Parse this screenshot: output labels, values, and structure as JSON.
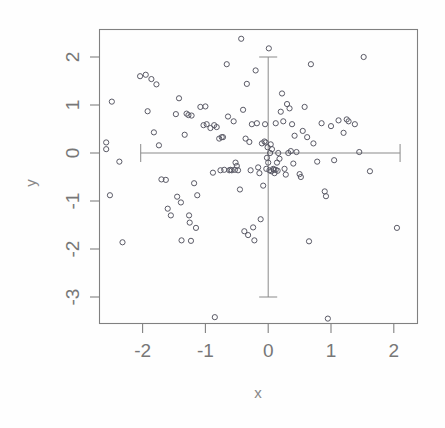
{
  "figure": {
    "title": "",
    "background_color": "#fefefe",
    "point_color": "#5a5a66",
    "axis_color": "#808080",
    "label_color": "#777777"
  },
  "axes": {
    "x_label": "x",
    "y_label": "y",
    "x_ticks": [
      "-2",
      "-1",
      "0",
      "1",
      "2"
    ],
    "y_ticks": [
      "2",
      "1",
      "0",
      "-1",
      "-2",
      "-3"
    ]
  },
  "chart_data": {
    "type": "scatter",
    "title": "",
    "xlabel": "x",
    "ylabel": "y",
    "xlim": [
      -2.7,
      2.35
    ],
    "ylim": [
      -3.6,
      2.45
    ],
    "x_ticks": [
      -2,
      -1,
      0,
      1,
      2
    ],
    "y_ticks": [
      2,
      1,
      0,
      -1,
      -2,
      -3
    ],
    "grid": false,
    "legend": false,
    "marker": "open-circle",
    "annotations": [
      {
        "name": "horizontal-whisker",
        "orientation": "horizontal",
        "at": 0.0,
        "from": -2.03,
        "to": 2.1,
        "caps": true
      },
      {
        "name": "vertical-whisker",
        "orientation": "vertical",
        "at": 0.0,
        "from": -3.0,
        "to": 2.0,
        "caps": true
      }
    ],
    "points": [
      [
        -2.58,
        0.22
      ],
      [
        -2.58,
        0.08
      ],
      [
        -2.49,
        1.07
      ],
      [
        -2.52,
        -0.88
      ],
      [
        -2.37,
        -0.18
      ],
      [
        -2.32,
        -1.86
      ],
      [
        -2.04,
        1.6
      ],
      [
        -1.95,
        1.63
      ],
      [
        -1.92,
        0.87
      ],
      [
        -1.86,
        1.54
      ],
      [
        -1.82,
        0.43
      ],
      [
        -1.78,
        1.43
      ],
      [
        -1.74,
        0.16
      ],
      [
        -1.7,
        -0.55
      ],
      [
        -1.63,
        -0.56
      ],
      [
        -1.6,
        -1.16
      ],
      [
        -1.55,
        -1.3
      ],
      [
        -1.45,
        -0.91
      ],
      [
        -1.42,
        1.14
      ],
      [
        -1.47,
        0.81
      ],
      [
        -1.39,
        -1.03
      ],
      [
        -1.38,
        -1.82
      ],
      [
        -1.33,
        0.38
      ],
      [
        -1.3,
        0.82
      ],
      [
        -1.27,
        0.79
      ],
      [
        -1.26,
        -1.3
      ],
      [
        -1.25,
        -1.45
      ],
      [
        -1.23,
        -1.83
      ],
      [
        -1.22,
        0.78
      ],
      [
        -1.18,
        -0.63
      ],
      [
        -1.15,
        -1.56
      ],
      [
        -1.13,
        -0.88
      ],
      [
        -1.08,
        0.96
      ],
      [
        -1.03,
        0.58
      ],
      [
        -1.0,
        0.97
      ],
      [
        -0.98,
        0.6
      ],
      [
        -0.92,
        0.52
      ],
      [
        -0.88,
        -0.41
      ],
      [
        -0.86,
        0.58
      ],
      [
        -0.85,
        -3.42
      ],
      [
        -0.82,
        0.54
      ],
      [
        -0.78,
        0.3
      ],
      [
        -0.76,
        -0.36
      ],
      [
        -0.74,
        0.33
      ],
      [
        -0.72,
        0.33
      ],
      [
        -0.7,
        -0.35
      ],
      [
        -0.66,
        1.85
      ],
      [
        -0.64,
        0.76
      ],
      [
        -0.62,
        -0.36
      ],
      [
        -0.58,
        -0.36
      ],
      [
        -0.55,
        0.66
      ],
      [
        -0.53,
        -0.35
      ],
      [
        -0.52,
        -0.2
      ],
      [
        -0.5,
        -0.27
      ],
      [
        -0.48,
        -0.36
      ],
      [
        -0.45,
        -0.76
      ],
      [
        -0.43,
        2.38
      ],
      [
        -0.4,
        0.9
      ],
      [
        -0.38,
        -1.63
      ],
      [
        -0.36,
        0.3
      ],
      [
        -0.34,
        1.44
      ],
      [
        -0.32,
        -1.71
      ],
      [
        -0.3,
        0.23
      ],
      [
        -0.28,
        -0.36
      ],
      [
        -0.26,
        0.6
      ],
      [
        -0.24,
        -1.55
      ],
      [
        -0.22,
        -1.82
      ],
      [
        -0.2,
        1.72
      ],
      [
        -0.18,
        0.62
      ],
      [
        -0.16,
        -0.3
      ],
      [
        -0.14,
        -0.42
      ],
      [
        -0.12,
        -1.38
      ],
      [
        -0.1,
        0.2
      ],
      [
        -0.08,
        -0.68
      ],
      [
        -0.06,
        0.24
      ],
      [
        -0.05,
        0.6
      ],
      [
        -0.04,
        0.22
      ],
      [
        -0.03,
        -0.33
      ],
      [
        -0.02,
        -0.1
      ],
      [
        -0.01,
        0.12
      ],
      [
        0.0,
        -0.2
      ],
      [
        0.01,
        2.18
      ],
      [
        0.02,
        -0.36
      ],
      [
        0.03,
        0.0
      ],
      [
        0.04,
        0.18
      ],
      [
        0.05,
        -0.38
      ],
      [
        0.06,
        0.08
      ],
      [
        0.08,
        -0.33
      ],
      [
        0.1,
        -0.42
      ],
      [
        0.12,
        0.62
      ],
      [
        0.14,
        -0.2
      ],
      [
        0.16,
        0.0
      ],
      [
        0.18,
        -0.12
      ],
      [
        0.2,
        0.86
      ],
      [
        0.22,
        1.24
      ],
      [
        0.24,
        0.66
      ],
      [
        0.26,
        -0.33
      ],
      [
        0.28,
        -0.45
      ],
      [
        0.3,
        1.02
      ],
      [
        0.32,
        0.0
      ],
      [
        0.34,
        0.93
      ],
      [
        0.36,
        0.04
      ],
      [
        0.38,
        0.6
      ],
      [
        0.4,
        -0.22
      ],
      [
        0.42,
        0.36
      ],
      [
        0.45,
        0.02
      ],
      [
        0.5,
        -0.44
      ],
      [
        0.52,
        -0.5
      ],
      [
        0.55,
        0.46
      ],
      [
        0.58,
        0.96
      ],
      [
        0.62,
        0.33
      ],
      [
        0.65,
        -1.84
      ],
      [
        0.68,
        1.85
      ],
      [
        0.72,
        0.2
      ],
      [
        0.78,
        -0.18
      ],
      [
        0.85,
        0.62
      ],
      [
        0.9,
        -0.8
      ],
      [
        0.92,
        -0.9
      ],
      [
        0.95,
        -3.45
      ],
      [
        1.0,
        0.56
      ],
      [
        1.05,
        -0.15
      ],
      [
        1.12,
        0.68
      ],
      [
        1.2,
        0.42
      ],
      [
        1.25,
        0.7
      ],
      [
        1.28,
        0.66
      ],
      [
        1.38,
        0.6
      ],
      [
        1.45,
        0.02
      ],
      [
        1.52,
        2.0
      ],
      [
        1.62,
        -0.38
      ],
      [
        2.05,
        -1.56
      ],
      [
        -0.6,
        -0.35
      ],
      [
        0.09,
        -0.35
      ],
      [
        0.12,
        -0.35
      ],
      [
        0.15,
        -0.37
      ]
    ]
  }
}
